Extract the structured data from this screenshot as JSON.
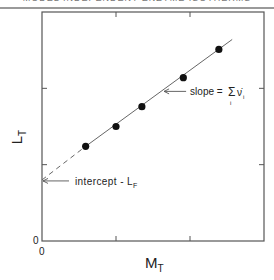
{
  "page": {
    "running_head": "MODEL INDEPENDENT ENZYME ISOTHERMS"
  },
  "chart_data": {
    "type": "scatter",
    "title": "",
    "xlabel": "M_T",
    "xlabel_main": "M",
    "xlabel_sub": "T",
    "ylabel": "L_T",
    "ylabel_main": "L",
    "ylabel_sub": "T",
    "origin_labels": {
      "x": "0",
      "y": "0"
    },
    "xlim": [
      0,
      3
    ],
    "ylim": [
      0,
      3
    ],
    "x_ticks": [
      1,
      2
    ],
    "y_ticks": [
      1,
      2
    ],
    "tick_labels_shown": false,
    "grid": false,
    "series": [
      {
        "name": "data points",
        "marker": "filled-circle",
        "points": [
          {
            "x": 0.59,
            "y": 1.24
          },
          {
            "x": 1.0,
            "y": 1.5
          },
          {
            "x": 1.35,
            "y": 1.76
          },
          {
            "x": 1.91,
            "y": 2.14
          },
          {
            "x": 2.39,
            "y": 2.51
          }
        ]
      },
      {
        "name": "linear fit",
        "style": "solid",
        "points": [
          {
            "x": 0.59,
            "y": 1.24
          },
          {
            "x": 2.57,
            "y": 2.64
          }
        ]
      },
      {
        "name": "extrapolation",
        "style": "dashed",
        "points": [
          {
            "x": 0.0,
            "y": 0.8
          },
          {
            "x": 0.59,
            "y": 1.24
          }
        ]
      }
    ],
    "annotations": [
      {
        "text": "slope = Σ ν̇ᵢ",
        "main": "slope = ",
        "sum": "Σ",
        "sum_sub": "i",
        "symbol": "ν̇",
        "symbol_sub": "i",
        "arrow_to": {
          "x": 1.65,
          "y": 1.96
        }
      },
      {
        "text": "intercept - L_F",
        "main": "intercept - L",
        "sub": "F",
        "arrow_to": {
          "x": 0.0,
          "y": 0.8
        }
      }
    ],
    "legend": null
  }
}
